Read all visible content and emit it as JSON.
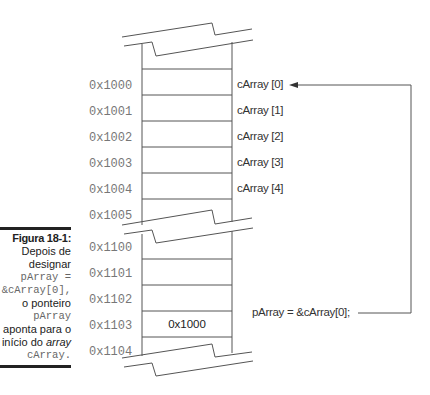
{
  "figure": {
    "label": "Figura 18-1:",
    "caption_lines": [
      {
        "text": "Depois de",
        "style": "normal"
      },
      {
        "text": "designar",
        "style": "normal"
      },
      {
        "text": "pArray =",
        "style": "mono"
      },
      {
        "text": "&cArray[0],",
        "style": "mono"
      },
      {
        "text": "o ponteiro",
        "style": "normal"
      },
      {
        "text": "pArray",
        "style": "mono"
      },
      {
        "text": "aponta para o",
        "style": "normal"
      }
    ],
    "caption_last_prefix": "início do ",
    "caption_last_italic": "array",
    "caption_end": "cArray."
  },
  "memory_upper": {
    "addresses": [
      "0x1000",
      "0x1001",
      "0x1002",
      "0x1003",
      "0x1004",
      "0x1005"
    ],
    "elements": [
      "cArray [0]",
      "cArray [1]",
      "cArray [2]",
      "cArray [3]",
      "cArray [4]"
    ]
  },
  "memory_lower": {
    "addresses": [
      "0x1100",
      "0x1101",
      "0x1102",
      "0x1103",
      "0x1104"
    ],
    "stored_value": "0x1000"
  },
  "pointer_statement": "pArray = &cArray[0];",
  "colors": {
    "line": "#555555",
    "address_text": "#777777",
    "label_text": "#333333"
  }
}
